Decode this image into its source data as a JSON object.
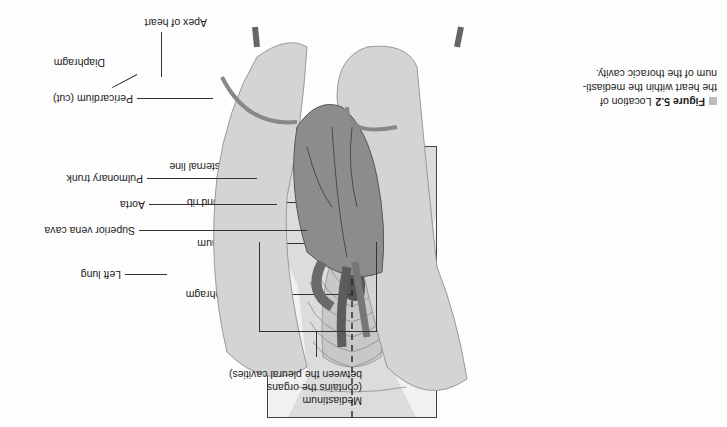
{
  "orientation": "rotated-180",
  "figure": {
    "number": "Figure 5.2",
    "caption_lines": [
      "Location of",
      "the heart within the mediasti-",
      "num of the thoracic cavity."
    ]
  },
  "inset_labels": {
    "midsternal_line": "Midsternal line",
    "second_rib": "Second rib",
    "sternum": "Sternum",
    "diaphragm": "Diaphragm"
  },
  "main_labels": {
    "mediastinum": [
      "Mediastinum",
      "(contains the organs",
      "between the pleural cavities)"
    ],
    "left_lung": "Left lung",
    "superior_vena_cava": "Superior vena cava",
    "aorta": "Aorta",
    "pulmonary_trunk": "Pulmonary trunk",
    "pericardium": "Pericardium (cut)",
    "diaphragm": "Diaphragm",
    "apex": "Apex of heart"
  },
  "colors": {
    "lung": "#d4d4d4",
    "lung_shade": "#a8a8a8",
    "heart": "#7a7a7a",
    "vessel": "#5c5c5c",
    "caption_square": "#bbbbbb"
  }
}
